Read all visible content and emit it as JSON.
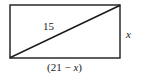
{
  "figure": {
    "kind": "geometry-diagram",
    "shape": "rectangle-with-diagonal",
    "labels": {
      "diagonal": "15",
      "height": "x",
      "width_prefix": "(21 ",
      "width_operator": "− ",
      "width_variable": "x",
      "width_suffix": ")",
      "width_full": "(21 − x)"
    },
    "colors": {
      "stroke": "#1a1a1a",
      "background": "#ffffff",
      "text": "#1a1a1a"
    },
    "geometry": {
      "left": 10,
      "top": 5,
      "right": 120,
      "bottom": 58,
      "diagonal_from": "bottom-left",
      "diagonal_to": "top-right"
    }
  }
}
